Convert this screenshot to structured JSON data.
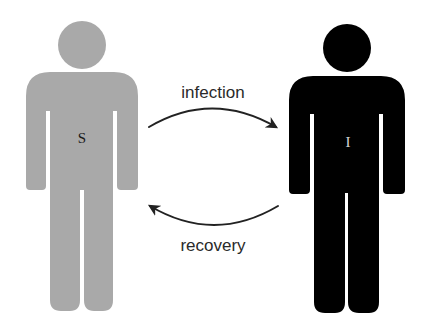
{
  "diagram": {
    "type": "SIS compartment model",
    "nodes": [
      {
        "id": "S",
        "label": "S",
        "figure_color": "#a9a9a9",
        "label_color": "#1a1a1a"
      },
      {
        "id": "I",
        "label": "I",
        "figure_color": "#000000",
        "label_color": "#d8d8d8"
      }
    ],
    "edges": [
      {
        "from": "S",
        "to": "I",
        "label": "infection"
      },
      {
        "from": "I",
        "to": "S",
        "label": "recovery"
      }
    ],
    "colors": {
      "background": "#ffffff",
      "arrow": "#222222",
      "text": "#2a2a2a"
    }
  }
}
